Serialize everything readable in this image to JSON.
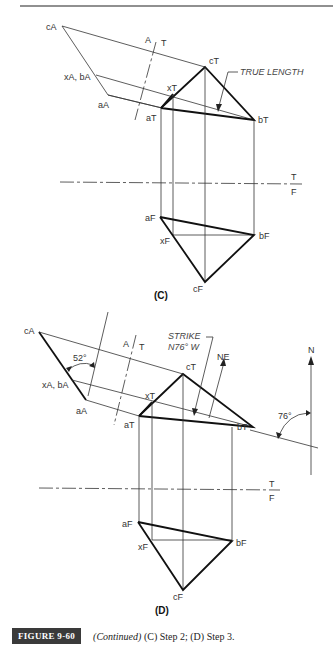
{
  "figure": {
    "badge": "FIGURE 9-60",
    "caption_italic": "(Continued)",
    "caption_rest": " (C) Step 2; (D) Step 3."
  },
  "panel_c": {
    "label": "(C)",
    "points": {
      "cA": "cA",
      "xA_bA": "xA, bA",
      "aA": "aA",
      "cT": "cT",
      "xT": "xT",
      "aT": "aT",
      "bT": "bT",
      "aF": "aF",
      "xF": "xF",
      "bF": "bF",
      "cF": "cF"
    },
    "fold_AT": {
      "A": "A",
      "T": "T"
    },
    "fold_TF": {
      "T": "T",
      "F": "F"
    },
    "annotation": "TRUE LENGTH"
  },
  "panel_d": {
    "label": "(D)",
    "points": {
      "cA": "cA",
      "xA_bA": "xA, bA",
      "aA": "aA",
      "cT": "cT",
      "xT": "xT",
      "aT": "aT",
      "bT": "bT",
      "aF": "aF",
      "xF": "xF",
      "bF": "bF",
      "cF": "cF"
    },
    "fold_AT": {
      "A": "A",
      "T": "T"
    },
    "fold_TF": {
      "T": "T",
      "F": "F"
    },
    "dip_angle": "52°",
    "strike_line1": "STRIKE",
    "strike_line2": "N76° W",
    "ne": "NE",
    "north": "N",
    "bearing_angle": "76°"
  }
}
